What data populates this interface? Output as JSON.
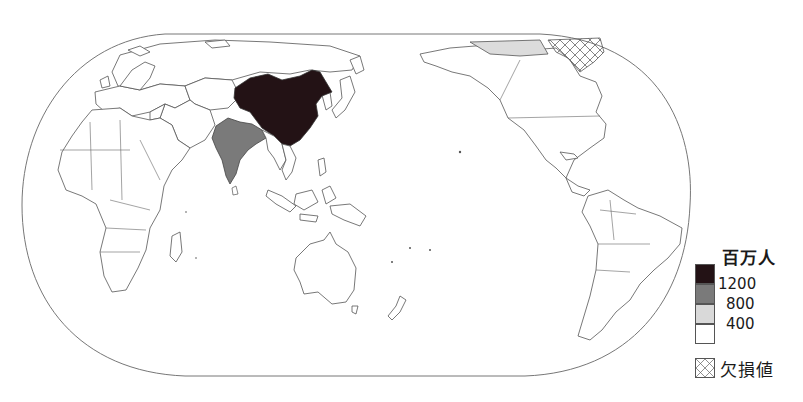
{
  "map": {
    "projection": "Eckert IV (Pacific-centered)",
    "subject": "Population by country",
    "highlighted_countries": [
      {
        "name": "China",
        "class": "over 1200",
        "color": "#231215"
      },
      {
        "name": "India",
        "class": "800-1200",
        "color": "#7a7a7a"
      }
    ],
    "missing_region": "Greenland",
    "other_countries_class": "under 400",
    "colors": {
      "outline": "#555555",
      "ocean": "#ffffff",
      "land_default": "#ffffff"
    }
  },
  "legend": {
    "unit": "百万人",
    "bins": [
      {
        "label": "1200",
        "color": "#231215"
      },
      {
        "label": "800",
        "color": "#7a7a7a"
      },
      {
        "label": "400",
        "color": "#d9d9d9"
      },
      {
        "label": "",
        "color": "#ffffff"
      }
    ],
    "thresholds": [
      "1200",
      "800",
      "400"
    ],
    "missing_label": "欠損値",
    "missing_pattern": "crosshatch"
  }
}
